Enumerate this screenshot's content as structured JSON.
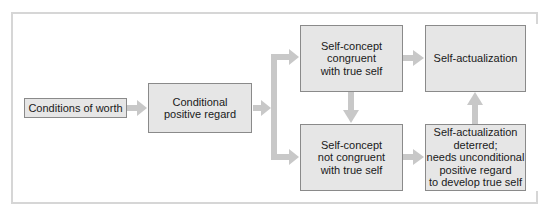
{
  "diagram": {
    "colors": {
      "box_fill": "#e6e6e6",
      "box_border": "#8a8a8a",
      "arrow": "#c8c8c8",
      "frame": "#d6d6d6",
      "text": "#1a1a1a"
    },
    "nodes": [
      {
        "id": "conditions-of-worth",
        "label": "Conditions of worth"
      },
      {
        "id": "conditional-positive-regard",
        "label": "Conditional\npositive regard"
      },
      {
        "id": "self-concept-congruent",
        "label": "Self-concept\ncongruent\nwith true self"
      },
      {
        "id": "self-actualization",
        "label": "Self-actualization"
      },
      {
        "id": "self-concept-not-congruent",
        "label": "Self-concept\nnot congruent\nwith true self"
      },
      {
        "id": "self-actualization-deterred",
        "label": "Self-actualization\ndeterred;\nneeds unconditional\npositive regard\nto develop true self"
      }
    ],
    "edges": [
      {
        "from": "conditions-of-worth",
        "to": "conditional-positive-regard"
      },
      {
        "from": "conditional-positive-regard",
        "to": "self-concept-congruent"
      },
      {
        "from": "conditional-positive-regard",
        "to": "self-concept-not-congruent"
      },
      {
        "from": "self-concept-congruent",
        "to": "self-actualization"
      },
      {
        "from": "self-concept-congruent",
        "to": "self-concept-not-congruent"
      },
      {
        "from": "self-concept-not-congruent",
        "to": "self-actualization-deterred"
      },
      {
        "from": "self-actualization-deterred",
        "to": "self-actualization"
      }
    ]
  }
}
